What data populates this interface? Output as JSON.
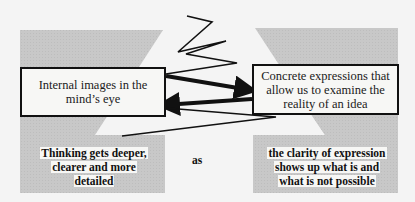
{
  "diagram": {
    "left_box": {
      "text": "Internal images in the mind’s eye"
    },
    "right_box": {
      "text": "Concrete expressions that allow us to examine the reality of an idea"
    },
    "left_caption": {
      "lines": [
        "Thinking gets deeper,",
        "clearer and more",
        "detailed"
      ]
    },
    "connector_word": "as",
    "right_caption": {
      "lines": [
        "the clarity of expression",
        "shows up what is and",
        "what is not possible"
      ]
    },
    "arrows": [
      {
        "from": "left_box",
        "to": "right_box",
        "style": "thick"
      },
      {
        "from": "right_box",
        "to": "left_box",
        "style": "thick"
      }
    ],
    "colors": {
      "background": "#f4f4f4",
      "gray_panel": "#c9c9c9",
      "box_fill": "#f7f7f5",
      "stroke": "#111111"
    }
  }
}
